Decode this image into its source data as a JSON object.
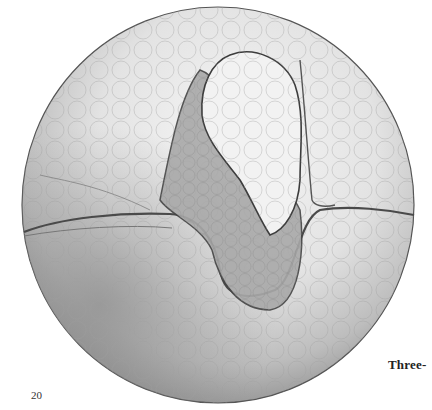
{
  "page": {
    "page_number": "20",
    "caption_fragment": "Three-"
  },
  "illustration": {
    "subject": "pencil drawing of a spherical embryo with an S-shaped fold",
    "palette": {
      "paper": "#ffffff",
      "light_shade": "#efefef",
      "mid_shade": "#c8c8c8",
      "dark_shade": "#8a8a8a",
      "outline": "#555555"
    }
  }
}
